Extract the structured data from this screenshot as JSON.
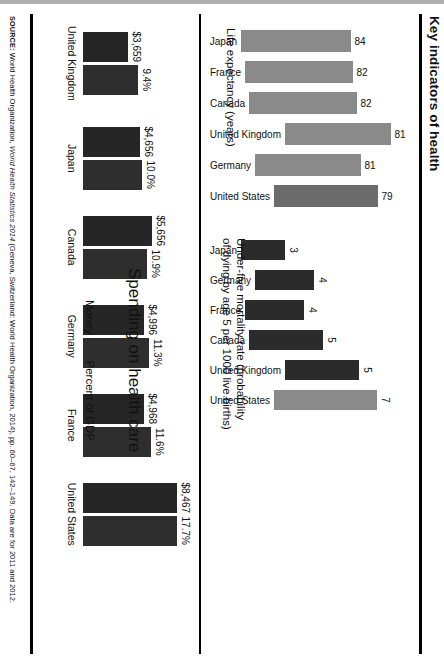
{
  "figure": {
    "title": "Key indicators of health",
    "source_prefix": "SOURCE:",
    "source_a": " World Health Organization, ",
    "source_italic": "World Health Statistics 2014",
    "source_b": " (Geneva, Switzerland: World Health Organization, 2014), pp. 60–67, 142–149. Data are for 2011 and 2012."
  },
  "chart_data": [
    {
      "type": "bar",
      "id": "life-expectancy",
      "title": "Life expectancy (years)",
      "caption": "Life expectancy (years)",
      "categories": [
        "Japan",
        "France",
        "Canada",
        "United Kingdom",
        "Germany",
        "United States"
      ],
      "values": [
        84,
        82,
        82,
        81,
        81,
        79
      ],
      "value_labels": [
        "84",
        "82",
        "82",
        "81",
        "81",
        "79"
      ],
      "colors": [
        "#8a8a8a",
        "#8a8a8a",
        "#8a8a8a",
        "#8a8a8a",
        "#8a8a8a",
        "#6b6b6b"
      ],
      "highlight": "United States",
      "xlabel": "",
      "ylabel": "Years",
      "ylim": [
        0,
        90
      ],
      "grid": false,
      "legend": "none"
    },
    {
      "type": "bar",
      "id": "under-five-mortality",
      "title": "Under-five mortality rate (probability of dying by age 5 per 1000 live births)",
      "caption": "Under-five mortality rate (probability\nof dying by age 5 per 1000 live births)",
      "categories": [
        "Japan",
        "Germany",
        "France",
        "Canada",
        "United Kingdom",
        "United States"
      ],
      "values": [
        3,
        4,
        4,
        5,
        5,
        7
      ],
      "value_labels": [
        "3",
        "4",
        "4",
        "5",
        "5",
        "7"
      ],
      "colors": [
        "#2b2b2b",
        "#2b2b2b",
        "#2b2b2b",
        "#2b2b2b",
        "#2b2b2b",
        "#8a8a8a"
      ],
      "highlight": "United States",
      "xlabel": "",
      "ylabel": "Deaths per 1000 live births",
      "ylim": [
        0,
        8
      ],
      "grid": false,
      "legend": "none"
    },
    {
      "type": "bar",
      "id": "spending-on-health-care",
      "title": "Spending on health care",
      "categories": [
        "United Kingdom",
        "Japan",
        "Canada",
        "Germany",
        "France",
        "United States"
      ],
      "series": [
        {
          "name": "Money",
          "unit": "USD per capita",
          "values": [
            3659,
            4656,
            5656,
            4996,
            4968,
            8467
          ],
          "labels": [
            "$3,659",
            "$4,656",
            "$5,656",
            "$4,996",
            "$4,968",
            "$8,467"
          ],
          "color": "#262626"
        },
        {
          "name": "Percent of GDP",
          "unit": "%",
          "values": [
            9.4,
            10.0,
            10.9,
            11.3,
            11.6,
            17.7
          ],
          "labels": [
            "9.4%",
            "10.0%",
            "10.9%",
            "11.3%",
            "11.6%",
            "17.7%"
          ],
          "color": "#2e2e2e"
        }
      ],
      "legend": [
        "Money",
        "Percent of GDP"
      ],
      "legend_position": "bottom-center",
      "xlabel": "",
      "ylabel": "",
      "grid": false
    }
  ],
  "legend": {
    "money_label": "Money",
    "gdp_label": "Percent of GDP"
  }
}
